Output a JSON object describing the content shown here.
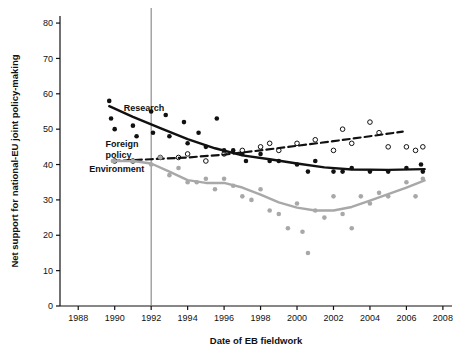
{
  "chart_data": {
    "type": "scatter",
    "title": "",
    "xlabel": "Date of EB fieldwork",
    "ylabel": "Net support for national-EU joint policy-making",
    "xlim": [
      1987,
      2008.5
    ],
    "ylim": [
      0,
      82
    ],
    "xticks": [
      1988,
      1990,
      1992,
      1994,
      1996,
      1998,
      2000,
      2002,
      2004,
      2006,
      2008
    ],
    "yticks": [
      0,
      10,
      20,
      30,
      40,
      50,
      60,
      70,
      80
    ],
    "grid": false,
    "legend": "inline-labels",
    "vertical_marker": 1992,
    "series": [
      {
        "name": "Research",
        "label": "Research",
        "label_x": 1990.5,
        "label_y": 55,
        "color": "#111111",
        "line_style": "solid",
        "points": [
          {
            "x": 1989.7,
            "y": 58
          },
          {
            "x": 1989.8,
            "y": 53
          },
          {
            "x": 1990.0,
            "y": 50
          },
          {
            "x": 1991.0,
            "y": 51
          },
          {
            "x": 1991.2,
            "y": 48
          },
          {
            "x": 1992.0,
            "y": 55
          },
          {
            "x": 1992.1,
            "y": 49
          },
          {
            "x": 1992.8,
            "y": 54
          },
          {
            "x": 1993.0,
            "y": 48
          },
          {
            "x": 1993.8,
            "y": 52
          },
          {
            "x": 1994.0,
            "y": 46
          },
          {
            "x": 1994.6,
            "y": 49
          },
          {
            "x": 1995.0,
            "y": 45
          },
          {
            "x": 1995.6,
            "y": 53
          },
          {
            "x": 1996.0,
            "y": 44
          },
          {
            "x": 1996.5,
            "y": 44
          },
          {
            "x": 1997.0,
            "y": 43
          },
          {
            "x": 1997.2,
            "y": 41
          },
          {
            "x": 1998.0,
            "y": 43
          },
          {
            "x": 1998.5,
            "y": 41
          },
          {
            "x": 1999.0,
            "y": 41
          },
          {
            "x": 2000.0,
            "y": 40
          },
          {
            "x": 2000.6,
            "y": 38
          },
          {
            "x": 2001.0,
            "y": 41
          },
          {
            "x": 2002.0,
            "y": 38
          },
          {
            "x": 2002.5,
            "y": 38
          },
          {
            "x": 2003.0,
            "y": 39
          },
          {
            "x": 2004.0,
            "y": 38
          },
          {
            "x": 2005.0,
            "y": 38
          },
          {
            "x": 2006.0,
            "y": 39
          },
          {
            "x": 2006.8,
            "y": 40
          },
          {
            "x": 2006.9,
            "y": 38
          }
        ],
        "trend": [
          {
            "x": 1989.7,
            "y": 56.5
          },
          {
            "x": 1991.0,
            "y": 53.5
          },
          {
            "x": 1992.5,
            "y": 50.3
          },
          {
            "x": 1994.0,
            "y": 47.2
          },
          {
            "x": 1995.5,
            "y": 44.6
          },
          {
            "x": 1997.0,
            "y": 42.6
          },
          {
            "x": 1998.5,
            "y": 41.5
          },
          {
            "x": 2000.0,
            "y": 40.3
          },
          {
            "x": 2001.5,
            "y": 39.2
          },
          {
            "x": 2003.0,
            "y": 38.6
          },
          {
            "x": 2005.0,
            "y": 38.5
          },
          {
            "x": 2007.0,
            "y": 38.7
          }
        ]
      },
      {
        "name": "Foreign policy",
        "label": "Foreign\npolicy",
        "label_line1": "Foreign",
        "label_line2": "policy",
        "label_x": 1989.5,
        "label_y": 45,
        "color": "#111111",
        "line_style": "dashed",
        "points": [
          {
            "x": 1990.0,
            "y": 41
          },
          {
            "x": 1991.0,
            "y": 41
          },
          {
            "x": 1992.5,
            "y": 42
          },
          {
            "x": 1993.5,
            "y": 42
          },
          {
            "x": 1994.0,
            "y": 43
          },
          {
            "x": 1995.0,
            "y": 41
          },
          {
            "x": 1996.0,
            "y": 43
          },
          {
            "x": 1997.0,
            "y": 44
          },
          {
            "x": 1998.0,
            "y": 45
          },
          {
            "x": 1998.5,
            "y": 46
          },
          {
            "x": 1999.0,
            "y": 44
          },
          {
            "x": 2000.0,
            "y": 46
          },
          {
            "x": 2001.0,
            "y": 47
          },
          {
            "x": 2002.0,
            "y": 44
          },
          {
            "x": 2002.5,
            "y": 50
          },
          {
            "x": 2003.0,
            "y": 46
          },
          {
            "x": 2004.0,
            "y": 52
          },
          {
            "x": 2004.5,
            "y": 49
          },
          {
            "x": 2005.0,
            "y": 45
          },
          {
            "x": 2006.0,
            "y": 45
          },
          {
            "x": 2006.5,
            "y": 44
          },
          {
            "x": 2006.9,
            "y": 45
          }
        ],
        "trend": [
          {
            "x": 1989.9,
            "y": 41.0
          },
          {
            "x": 1992.0,
            "y": 41.5
          },
          {
            "x": 1994.0,
            "y": 42.0
          },
          {
            "x": 1996.0,
            "y": 42.8
          },
          {
            "x": 1998.0,
            "y": 44.0
          },
          {
            "x": 2000.0,
            "y": 45.3
          },
          {
            "x": 2002.0,
            "y": 46.6
          },
          {
            "x": 2004.0,
            "y": 48.0
          },
          {
            "x": 2005.8,
            "y": 49.3
          }
        ]
      },
      {
        "name": "Environment",
        "label": "Environment",
        "label_x": 1988.6,
        "label_y": 38,
        "color": "#a8a8a8",
        "line_style": "solid",
        "points": [
          {
            "x": 1989.9,
            "y": 41
          },
          {
            "x": 1991.0,
            "y": 41
          },
          {
            "x": 1992.0,
            "y": 40
          },
          {
            "x": 1992.5,
            "y": 42
          },
          {
            "x": 1993.0,
            "y": 37
          },
          {
            "x": 1993.5,
            "y": 39
          },
          {
            "x": 1994.0,
            "y": 35
          },
          {
            "x": 1994.5,
            "y": 35
          },
          {
            "x": 1995.0,
            "y": 36
          },
          {
            "x": 1995.5,
            "y": 33
          },
          {
            "x": 1996.0,
            "y": 36
          },
          {
            "x": 1996.5,
            "y": 34
          },
          {
            "x": 1997.0,
            "y": 31
          },
          {
            "x": 1997.5,
            "y": 30
          },
          {
            "x": 1998.0,
            "y": 33
          },
          {
            "x": 1998.5,
            "y": 27
          },
          {
            "x": 1999.0,
            "y": 26
          },
          {
            "x": 1999.5,
            "y": 22
          },
          {
            "x": 2000.0,
            "y": 29
          },
          {
            "x": 2000.3,
            "y": 21
          },
          {
            "x": 2000.6,
            "y": 15
          },
          {
            "x": 2001.0,
            "y": 27
          },
          {
            "x": 2001.5,
            "y": 25
          },
          {
            "x": 2002.0,
            "y": 31
          },
          {
            "x": 2002.5,
            "y": 26
          },
          {
            "x": 2003.0,
            "y": 22
          },
          {
            "x": 2003.5,
            "y": 31
          },
          {
            "x": 2004.0,
            "y": 29
          },
          {
            "x": 2004.5,
            "y": 32
          },
          {
            "x": 2005.0,
            "y": 31
          },
          {
            "x": 2006.0,
            "y": 35
          },
          {
            "x": 2006.5,
            "y": 31
          },
          {
            "x": 2006.9,
            "y": 36
          }
        ],
        "trend": [
          {
            "x": 1989.9,
            "y": 41.0
          },
          {
            "x": 1991.0,
            "y": 41.0
          },
          {
            "x": 1992.0,
            "y": 40.3
          },
          {
            "x": 1993.0,
            "y": 38.0
          },
          {
            "x": 1994.0,
            "y": 35.6
          },
          {
            "x": 1995.0,
            "y": 34.8
          },
          {
            "x": 1996.0,
            "y": 34.8
          },
          {
            "x": 1997.0,
            "y": 33.5
          },
          {
            "x": 1998.0,
            "y": 31.5
          },
          {
            "x": 1999.0,
            "y": 29.3
          },
          {
            "x": 2000.0,
            "y": 27.8
          },
          {
            "x": 2001.0,
            "y": 27.0
          },
          {
            "x": 2002.0,
            "y": 27.0
          },
          {
            "x": 2003.0,
            "y": 28.0
          },
          {
            "x": 2004.0,
            "y": 29.8
          },
          {
            "x": 2005.0,
            "y": 31.6
          },
          {
            "x": 2006.0,
            "y": 33.5
          },
          {
            "x": 2007.0,
            "y": 35.5
          }
        ]
      }
    ]
  }
}
